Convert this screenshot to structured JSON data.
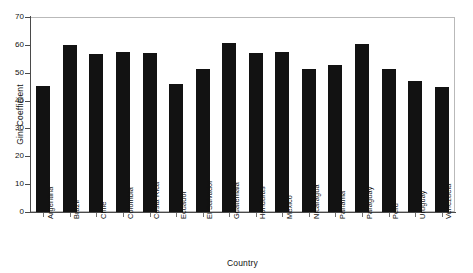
{
  "chart_data": {
    "type": "bar",
    "title": "",
    "xlabel": "Country",
    "ylabel": "Gini Coefficient",
    "ylim": [
      0,
      70
    ],
    "yticks": [
      0,
      10,
      20,
      30,
      40,
      50,
      60,
      70
    ],
    "grid": false,
    "legend": null,
    "bar_color": "#121212",
    "frame_color": "#b9b9b9",
    "axis_color": "#4a4a4a",
    "categories": [
      "Argentina",
      "Brazil",
      "Chile",
      "Colombia",
      "Costa Rica",
      "Ecuador",
      "El Salvador",
      "Guatemala",
      "Honduras",
      "Mexico",
      "Nicaragua",
      "Panama",
      "Paraguay",
      "Peru",
      "Uruguay",
      "Venezuela"
    ],
    "values": [
      45.2,
      59.9,
      56.7,
      57.4,
      57.2,
      45.9,
      51.5,
      60.6,
      57.0,
      57.4,
      51.3,
      52.8,
      60.3,
      51.4,
      47.0,
      44.8
    ]
  }
}
